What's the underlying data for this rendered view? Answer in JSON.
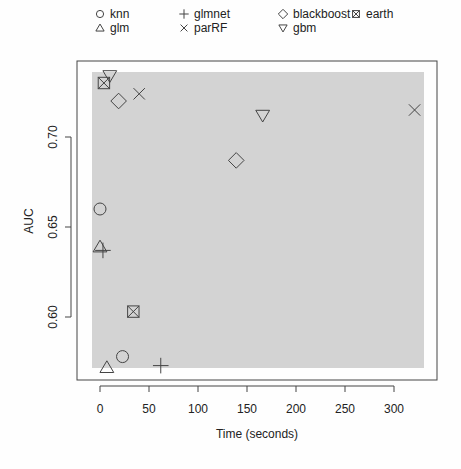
{
  "chart_data": {
    "type": "scatter",
    "title": "",
    "xlabel": "Time (seconds)",
    "ylabel": "AUC",
    "xlim": [
      -8,
      333
    ],
    "ylim": [
      0.5655,
      0.7425
    ],
    "xticks": [
      0,
      50,
      100,
      150,
      200,
      250,
      300
    ],
    "yticks": [
      0.6,
      0.65,
      0.7
    ],
    "ytick_labels": [
      "0.60",
      "0.65",
      "0.70"
    ],
    "grid": false,
    "legend_position": "top",
    "background_region": {
      "color": "#d3d3d3"
    },
    "series": [
      {
        "name": "knn",
        "marker": "circle",
        "points": [
          [
            0,
            0.66
          ],
          [
            23,
            0.578
          ]
        ]
      },
      {
        "name": "glm",
        "marker": "triangle-up",
        "points": [
          [
            0,
            0.639
          ],
          [
            7,
            0.572
          ]
        ]
      },
      {
        "name": "glmnet",
        "marker": "plus",
        "points": [
          [
            3,
            0.637
          ],
          [
            62,
            0.573
          ]
        ]
      },
      {
        "name": "parRF",
        "marker": "x",
        "points": [
          [
            40,
            0.724
          ],
          [
            321,
            0.715
          ]
        ]
      },
      {
        "name": "blackboost",
        "marker": "diamond",
        "points": [
          [
            19,
            0.72
          ],
          [
            139,
            0.687
          ]
        ]
      },
      {
        "name": "gbm",
        "marker": "triangle-down",
        "points": [
          [
            10,
            0.734
          ],
          [
            166,
            0.712
          ]
        ]
      },
      {
        "name": "earth",
        "marker": "square-x",
        "points": [
          [
            4,
            0.73
          ],
          [
            34,
            0.603
          ]
        ]
      }
    ]
  },
  "legend": {
    "items": [
      {
        "label": "knn",
        "marker": "circle"
      },
      {
        "label": "glm",
        "marker": "triangle-up"
      },
      {
        "label": "glmnet",
        "marker": "plus"
      },
      {
        "label": "parRF",
        "marker": "x"
      },
      {
        "label": "blackboost",
        "marker": "diamond"
      },
      {
        "label": "gbm",
        "marker": "triangle-down"
      },
      {
        "label": "earth",
        "marker": "square-x"
      }
    ]
  },
  "colors": {
    "ink": "#444444",
    "region": "#d3d3d3",
    "background": "#fefefe"
  }
}
